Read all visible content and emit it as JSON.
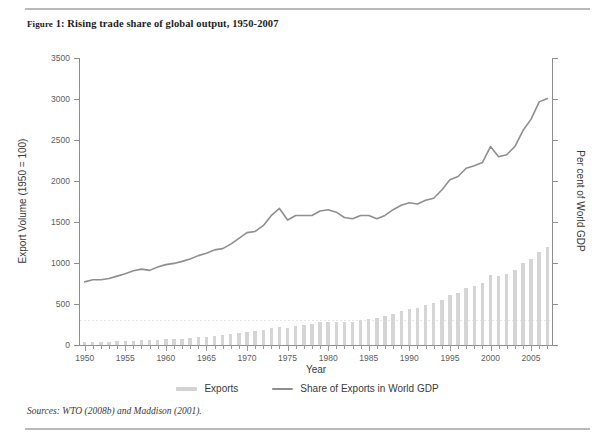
{
  "figure": {
    "label_prefix": "Figure",
    "title": "FIGURE 1: Rising trade share of global output, 1950-2007",
    "title_smallcaps": "Figure",
    "title_rest": " 1: Rising trade share of global output, 1950-2007",
    "sources": "Sources: WTO (2008b) and Maddison (2001)."
  },
  "legend": {
    "position": "bottom-center",
    "items": [
      {
        "label": "Exports",
        "type": "bar",
        "color": "#d2d2d2"
      },
      {
        "label": "Share of Exports in World GDP",
        "type": "line",
        "color": "#8f8f8f"
      }
    ]
  },
  "colors": {
    "bar": "#d5d5d5",
    "line": "#8f8f8f",
    "axis": "#8e8e8e",
    "grid": "#e6e6e6",
    "rule": "#b9b9b9",
    "text": "#3a3a3a"
  },
  "chart_data": {
    "type": "bar",
    "title": "Rising trade share of global output, 1950-2007",
    "xlabel": "Year",
    "ylabel": "Export Volume (1950 = 100)",
    "ylabel_secondary": "Per cent of World GDP",
    "ylim": [
      0,
      3500
    ],
    "yticks": [
      0,
      500,
      1000,
      1500,
      2000,
      2500,
      3000,
      3500
    ],
    "ytick_labels": [
      "0",
      "500",
      "1000",
      "1500",
      "2000",
      "2500",
      "3000",
      "3500"
    ],
    "y2lim": [
      0,
      35
    ],
    "y2ticks": [
      0,
      5,
      10,
      15,
      20,
      25,
      30,
      35
    ],
    "y2tick_labels": [
      "",
      "",
      "",
      "",
      "",
      "",
      "",
      ""
    ],
    "xlim": [
      1949.3,
      2007.7
    ],
    "xticks": [
      1950,
      1955,
      1960,
      1965,
      1970,
      1975,
      1980,
      1985,
      1990,
      1995,
      2000,
      2005
    ],
    "xtick_labels": [
      "1950",
      "1955",
      "1960",
      "1965",
      "1970",
      "1975",
      "1980",
      "1985",
      "1990",
      "1995",
      "2000",
      "2005"
    ],
    "minor_xticks_every": 1,
    "grid": "horizontal-dotted-single-at-300",
    "gridlines": [
      300
    ],
    "x": [
      1950,
      1951,
      1952,
      1953,
      1954,
      1955,
      1956,
      1957,
      1958,
      1959,
      1960,
      1961,
      1962,
      1963,
      1964,
      1965,
      1966,
      1967,
      1968,
      1969,
      1970,
      1971,
      1972,
      1973,
      1974,
      1975,
      1976,
      1977,
      1978,
      1979,
      1980,
      1981,
      1982,
      1983,
      1984,
      1985,
      1986,
      1987,
      1988,
      1989,
      1990,
      1991,
      1992,
      1993,
      1994,
      1995,
      1996,
      1997,
      1998,
      1999,
      2000,
      2001,
      2002,
      2003,
      2004,
      2005,
      2006,
      2007
    ],
    "series": [
      {
        "name": "Exports",
        "type": "bar",
        "axis": "left",
        "unit": "index (1950 = 100)",
        "values": [
          100,
          113,
          112,
          120,
          133,
          148,
          163,
          172,
          171,
          186,
          207,
          218,
          233,
          251,
          279,
          301,
          327,
          352,
          392,
          439,
          482,
          502,
          546,
          620,
          650,
          620,
          690,
          730,
          770,
          820,
          840,
          835,
          815,
          840,
          905,
          925,
          960,
          1030,
          1125,
          1215,
          1290,
          1340,
          1420,
          1490,
          1620,
          1780,
          1880,
          2060,
          2130,
          2230,
          2500,
          2490,
          2560,
          2700,
          2950,
          3100,
          3350,
          3500
        ],
        "values_plotted": [
          32,
          38,
          38,
          41,
          45,
          50,
          55,
          59,
          58,
          63,
          70,
          74,
          79,
          85,
          95,
          102,
          111,
          120,
          133,
          149,
          164,
          171,
          186,
          211,
          221,
          211,
          235,
          248,
          262,
          279,
          286,
          284,
          277,
          286,
          308,
          315,
          327,
          350,
          383,
          413,
          439,
          456,
          483,
          507,
          551,
          606,
          640,
          701,
          725,
          759,
          851,
          847,
          871,
          919,
          1004,
          1055,
          1140,
          1191
        ]
      },
      {
        "name": "Share of Exports in World GDP",
        "type": "line",
        "axis": "right",
        "unit": "per cent of world GDP",
        "values": [
          5.5,
          5.7,
          5.7,
          5.8,
          6.0,
          6.2,
          6.5,
          6.6,
          6.5,
          6.8,
          7.0,
          7.1,
          7.3,
          7.5,
          7.8,
          8.0,
          8.3,
          8.4,
          8.8,
          9.3,
          9.8,
          9.9,
          10.4,
          11.3,
          11.9,
          10.9,
          11.3,
          11.3,
          11.3,
          11.7,
          11.8,
          11.6,
          11.1,
          11.0,
          11.3,
          11.3,
          11.0,
          11.3,
          11.8,
          12.2,
          12.4,
          12.3,
          12.6,
          12.8,
          13.5,
          14.4,
          14.7,
          15.4,
          15.6,
          15.9,
          17.3,
          16.4,
          16.6,
          17.3,
          18.7,
          19.7,
          21.2,
          21.5
        ],
        "values_plotted": [
          770,
          795,
          795,
          810,
          840,
          870,
          905,
          925,
          910,
          950,
          980,
          995,
          1020,
          1050,
          1090,
          1120,
          1160,
          1175,
          1230,
          1300,
          1370,
          1385,
          1455,
          1580,
          1665,
          1525,
          1580,
          1580,
          1580,
          1635,
          1650,
          1620,
          1555,
          1540,
          1580,
          1580,
          1540,
          1580,
          1650,
          1705,
          1735,
          1720,
          1765,
          1790,
          1890,
          2015,
          2055,
          2155,
          2185,
          2225,
          2420,
          2295,
          2320,
          2420,
          2615,
          2755,
          2965,
          3005
        ]
      }
    ]
  }
}
